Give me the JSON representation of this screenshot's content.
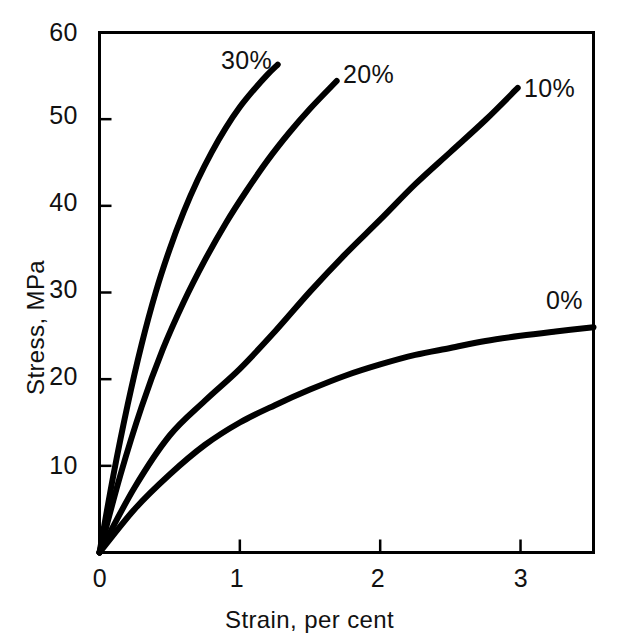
{
  "chart_data": {
    "type": "line",
    "title": "",
    "xlabel": "Strain, per cent",
    "ylabel": "Stress, MPa",
    "xlim": [
      0,
      3.52
    ],
    "ylim": [
      0,
      60
    ],
    "xticks": [
      "0",
      "1",
      "2",
      "3"
    ],
    "xtick_values": [
      0,
      1,
      2,
      3
    ],
    "yticks": [
      "10",
      "20",
      "30",
      "40",
      "50",
      "60"
    ],
    "ytick_values": [
      10,
      20,
      30,
      40,
      50,
      60
    ],
    "grid": false,
    "legend_position": "inline-end-of-curve",
    "line_color": "#000000",
    "axis_color": "#000000",
    "background": "#ffffff",
    "series": [
      {
        "name": "30%",
        "label": "30%",
        "x": [
          0,
          0.1,
          0.2,
          0.3,
          0.4,
          0.5,
          0.6,
          0.7,
          0.8,
          0.9,
          1.0,
          1.1,
          1.2,
          1.27
        ],
        "y": [
          0,
          9.0,
          17.0,
          24.0,
          30.0,
          35.0,
          39.3,
          43.0,
          46.2,
          49.0,
          51.4,
          53.4,
          55.2,
          56.3
        ]
      },
      {
        "name": "20%",
        "label": "20%",
        "x": [
          0,
          0.15,
          0.3,
          0.45,
          0.6,
          0.75,
          0.9,
          1.05,
          1.2,
          1.35,
          1.5,
          1.69
        ],
        "y": [
          0,
          9.0,
          16.8,
          23.4,
          28.9,
          33.7,
          38.0,
          41.8,
          45.3,
          48.4,
          51.2,
          54.4
        ]
      },
      {
        "name": "10%",
        "label": "10%",
        "x": [
          0,
          0.25,
          0.5,
          0.75,
          1.0,
          1.25,
          1.5,
          1.75,
          2.0,
          2.25,
          2.5,
          2.75,
          2.98
        ],
        "y": [
          0,
          7.5,
          13.5,
          17.5,
          21.2,
          25.5,
          30.1,
          34.4,
          38.4,
          42.5,
          46.2,
          49.9,
          53.6
        ]
      },
      {
        "name": "0%",
        "label": "0%",
        "x": [
          0,
          0.25,
          0.5,
          0.75,
          1.0,
          1.25,
          1.5,
          1.75,
          2.0,
          2.25,
          2.5,
          2.75,
          3.0,
          3.25,
          3.52
        ],
        "y": [
          0,
          5.0,
          9.0,
          12.4,
          15.0,
          17.0,
          18.8,
          20.4,
          21.7,
          22.8,
          23.6,
          24.4,
          25.0,
          25.5,
          26.0
        ]
      }
    ],
    "annotations": [
      {
        "text": "30%",
        "x": 1.24,
        "y": 56.4
      },
      {
        "text": "20%",
        "x": 1.69,
        "y": 55.4
      },
      {
        "text": "10%",
        "x": 2.99,
        "y": 53.9
      },
      {
        "text": "0%",
        "x": 3.18,
        "y": 29.2
      }
    ]
  },
  "labels": {
    "x_axis_title": "Strain, per cent",
    "y_axis_title": "Stress, MPa",
    "series_30": "30%",
    "series_20": "20%",
    "series_10": "10%",
    "series_0": "0%",
    "y_60": "60",
    "y_50": "50",
    "y_40": "40",
    "y_30": "30",
    "y_20": "20",
    "y_10": "10",
    "x_0": "0",
    "x_1": "1",
    "x_2": "2",
    "x_3": "3"
  }
}
